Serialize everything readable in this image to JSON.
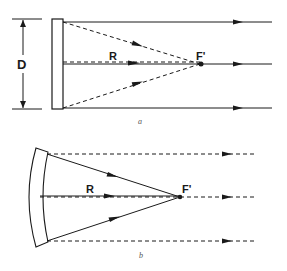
{
  "panel_a": {
    "caption": "a",
    "labels": {
      "diameter": "D",
      "radius": "R",
      "focus": "F'"
    }
  },
  "panel_b": {
    "caption": "b",
    "labels": {
      "radius": "R",
      "focus": "F'"
    }
  },
  "colors": {
    "ink": "#1a1a1a",
    "background": "#ffffff"
  }
}
